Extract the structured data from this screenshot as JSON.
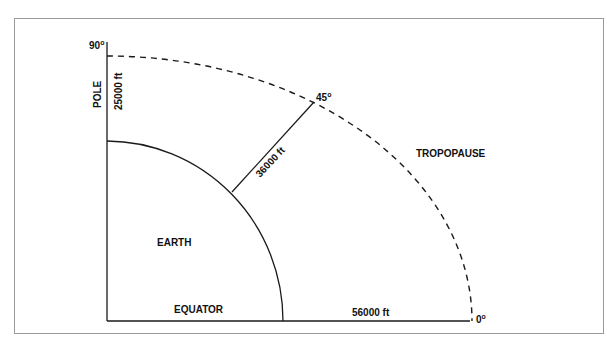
{
  "diagram": {
    "labels": {
      "angle_90": "90",
      "angle_45": "45",
      "angle_0": "0",
      "degree_symbol": "o",
      "pole": "POLE",
      "pole_height": "25000 ft",
      "mid_height": "36000 ft",
      "equator": "EQUATOR",
      "equator_height": "56000 ft",
      "earth": "EARTH",
      "tropopause": "TROPOPAUSE"
    },
    "colors": {
      "line": "#1a1a1a",
      "frame": "#9a9a9a",
      "background": "#ffffff"
    }
  }
}
